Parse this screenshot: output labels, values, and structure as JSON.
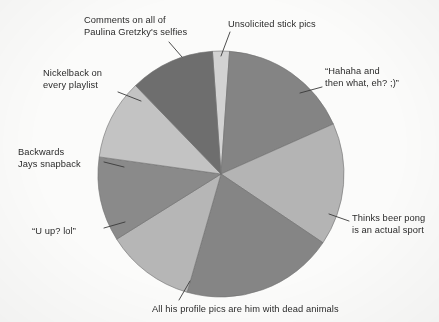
{
  "figure": {
    "background_color": "#fbfbfa",
    "text_color": "#2b2b2b",
    "leader_line_color": "#3a3a3a",
    "slice_edge_color": "#6f6f6f"
  },
  "chart_data": {
    "type": "pie",
    "title": "",
    "subtitle": "",
    "xlabel": "",
    "ylabel": "",
    "legend_position": "none",
    "grid": false,
    "labels_outside": true,
    "center": {
      "x": 221,
      "y": 174
    },
    "radius": 123,
    "start_angle_deg": -4,
    "direction": "clockwise",
    "categories": [
      "Unsolicited stick pics",
      "“Hahaha and then what, eh? ;)”",
      "Thinks beer pong is an actual sport",
      "All his profile pics are him with dead animals",
      "“U up? lol”",
      "Backwards Jays snapback",
      "Nickelback on every playlist",
      "Comments on all of Paulina Gretzky's selfies"
    ],
    "values": [
      8,
      62,
      58,
      72,
      42,
      40,
      38,
      40
    ],
    "value_unit": "degrees",
    "slices": [
      {
        "id": "unsolicited-stick-pics",
        "label_lines": [
          "Unsolicited stick pics"
        ],
        "angle_deg": 8,
        "start_deg": -4,
        "end_deg": 4,
        "color": "#d2d2d2",
        "label_x": 228,
        "label_y": 18,
        "label_align": "left",
        "leader": {
          "x1": 230,
          "y1": 32,
          "x2": 221,
          "y2": 56
        }
      },
      {
        "id": "hahaha-and-then-what",
        "label_lines": [
          "“Hahaha and",
          "then what, eh? ;)”"
        ],
        "angle_deg": 62,
        "start_deg": 4,
        "end_deg": 66,
        "color": "#848484",
        "label_x": 325,
        "label_y": 65,
        "label_align": "left",
        "leader": {
          "x1": 322,
          "y1": 87,
          "x2": 300,
          "y2": 93
        }
      },
      {
        "id": "thinks-beer-pong",
        "label_lines": [
          "Thinks beer pong",
          "is an actual sport"
        ],
        "angle_deg": 58,
        "start_deg": 66,
        "end_deg": 124,
        "color": "#b4b4b4",
        "label_x": 352,
        "label_y": 212,
        "label_align": "left",
        "leader": {
          "x1": 349,
          "y1": 221,
          "x2": 329,
          "y2": 214
        }
      },
      {
        "id": "dead-animals-profile-pics",
        "label_lines": [
          "All his profile pics are him with dead animals"
        ],
        "angle_deg": 72,
        "start_deg": 124,
        "end_deg": 196,
        "color": "#858585",
        "label_x": 152,
        "label_y": 303,
        "label_align": "left",
        "leader": {
          "x1": 179,
          "y1": 300,
          "x2": 190,
          "y2": 281
        }
      },
      {
        "id": "u-up-lol",
        "label_lines": [
          "“U up? lol”"
        ],
        "angle_deg": 42,
        "start_deg": 196,
        "end_deg": 238,
        "color": "#b6b6b6",
        "label_x": 32,
        "label_y": 225,
        "label_align": "left",
        "leader": {
          "x1": 104,
          "y1": 228,
          "x2": 125,
          "y2": 222
        }
      },
      {
        "id": "backwards-jays-snapback",
        "label_lines": [
          "Backwards",
          "Jays snapback"
        ],
        "angle_deg": 40,
        "start_deg": 238,
        "end_deg": 278,
        "color": "#8a8a8a",
        "label_x": 18,
        "label_y": 146,
        "label_align": "left",
        "leader": {
          "x1": 104,
          "y1": 162,
          "x2": 124,
          "y2": 167
        }
      },
      {
        "id": "nickelback-every-playlist",
        "label_lines": [
          "Nickelback on",
          "every playlist"
        ],
        "angle_deg": 38,
        "start_deg": 278,
        "end_deg": 316,
        "color": "#c3c3c3",
        "label_x": 43,
        "label_y": 67,
        "label_align": "left",
        "leader": {
          "x1": 118,
          "y1": 92,
          "x2": 141,
          "y2": 101
        }
      },
      {
        "id": "comments-paulina-gretzky-selfies",
        "label_lines": [
          "Comments on all of",
          "Paulina Gretzky's selfies"
        ],
        "angle_deg": 40,
        "start_deg": 316,
        "end_deg": 356,
        "color": "#6e6e6e",
        "label_x": 84,
        "label_y": 14,
        "label_align": "left",
        "leader": {
          "x1": 169,
          "y1": 42,
          "x2": 182,
          "y2": 57
        }
      }
    ]
  }
}
